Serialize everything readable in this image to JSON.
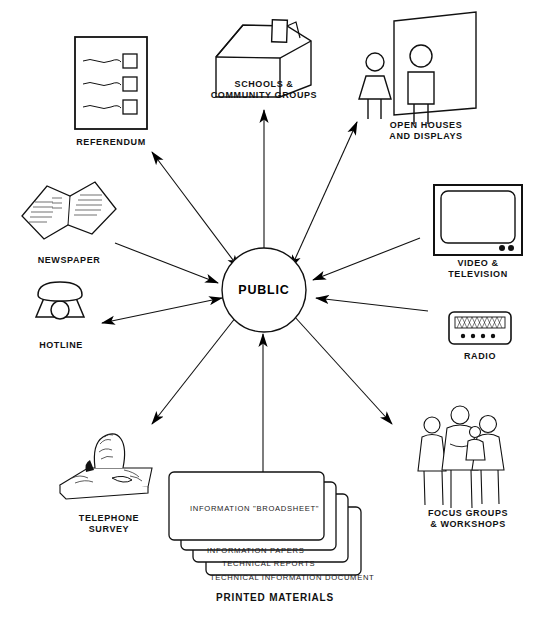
{
  "diagram": {
    "hub": {
      "label": "PUBLIC"
    },
    "colors": {
      "ink": "#000000",
      "paper": "#ffffff",
      "line": "#1a1a1a"
    },
    "nodes": [
      {
        "id": "referendum",
        "label": "REFERENDUM",
        "icon": "ballot-icon",
        "arrow": "both"
      },
      {
        "id": "schools",
        "label": "SCHOOLS &\nCOMMUNITY GROUPS",
        "icon": "school-building-icon",
        "arrow": "both"
      },
      {
        "id": "open-houses",
        "label": "OPEN HOUSES\nAND DISPLAYS",
        "icon": "people-display-panel-icon",
        "arrow": "both"
      },
      {
        "id": "newspaper",
        "label": "NEWSPAPER",
        "icon": "newspaper-icon",
        "arrow": "to-public"
      },
      {
        "id": "video-television",
        "label": "VIDEO &\nTELEVISION",
        "icon": "television-icon",
        "arrow": "to-public"
      },
      {
        "id": "hotline",
        "label": "HOTLINE",
        "icon": "telephone-icon",
        "arrow": "both"
      },
      {
        "id": "radio",
        "label": "RADIO",
        "icon": "radio-icon",
        "arrow": "to-public"
      },
      {
        "id": "telephone-survey",
        "label": "TELEPHONE\nSURVEY",
        "icon": "person-at-desk-phone-icon",
        "arrow": "from-public"
      },
      {
        "id": "focus-groups",
        "label": "FOCUS GROUPS\n& WORKSHOPS",
        "icon": "group-of-people-icon",
        "arrow": "from-public"
      },
      {
        "id": "printed-materials",
        "label": "PRINTED MATERIALS",
        "icon": "stacked-documents-icon",
        "arrow": "to-public"
      }
    ],
    "printed_materials": {
      "caption": "PRINTED MATERIALS",
      "cards": [
        "INFORMATION \"BROADSHEET\"",
        "INFORMATION PAPERS",
        "TECHNICAL REPORTS",
        "TECHNICAL INFORMATION DOCUMENT"
      ]
    }
  }
}
